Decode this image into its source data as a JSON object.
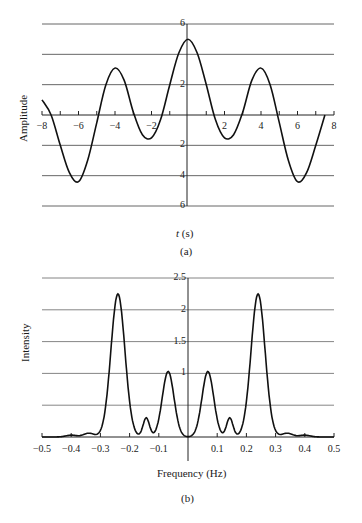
{
  "chart_data": [
    {
      "panel": "(a)",
      "type": "line",
      "title": "",
      "xlabel": "t (s)",
      "ylabel": "Amplitude",
      "xlim": [
        -8,
        8
      ],
      "ylim": [
        -6,
        6
      ],
      "x_ticks": [
        "-8",
        "-6",
        "-4",
        "-2",
        "2",
        "4",
        "6",
        "8"
      ],
      "y_ticks": [
        "6",
        "2",
        "2",
        "4",
        "6"
      ],
      "grid": "horizontal at -6,-4,-2,0,2,4,6",
      "series": [
        {
          "name": "signal",
          "x": [
            -8,
            -7.5,
            -7,
            -6.5,
            -6,
            -5.5,
            -5,
            -4.5,
            -4,
            -3.5,
            -3,
            -2.5,
            -2,
            -1.5,
            -1,
            -0.5,
            0,
            0.5,
            1,
            1.5,
            2,
            2.5,
            3,
            3.5,
            4,
            4.5,
            5,
            5.5,
            6,
            6.5,
            7,
            7.5
          ],
          "values": [
            1.0,
            0.0,
            -2.0,
            -3.8,
            -4.4,
            -3.0,
            -0.5,
            2.0,
            3.1,
            2.3,
            0.2,
            -1.3,
            -1.5,
            -0.3,
            2.0,
            4.1,
            5.0,
            4.1,
            2.0,
            -0.3,
            -1.5,
            -1.3,
            0.2,
            2.3,
            3.1,
            2.0,
            -0.5,
            -3.0,
            -4.4,
            -3.8,
            -2.0,
            0.0
          ]
        }
      ]
    },
    {
      "panel": "(b)",
      "type": "line",
      "title": "",
      "xlabel": "Frequency (Hz)",
      "ylabel": "Intensity",
      "xlim": [
        -0.5,
        0.5
      ],
      "ylim": [
        0,
        2.5
      ],
      "x_ticks": [
        "-0.5",
        "-0.4",
        "-0.3",
        "-0.2",
        "-0.1",
        "0.1",
        "0.2",
        "0.3",
        "0.4",
        "0.5"
      ],
      "y_ticks": [
        "2.5",
        "2",
        "1.5",
        "1"
      ],
      "grid": "horizontal at 0.5,1,1.5,2,2.5",
      "series": [
        {
          "name": "spectrum",
          "peaks": [
            {
              "x": -0.4,
              "y": 0.03
            },
            {
              "x": -0.34,
              "y": 0.06
            },
            {
              "x": -0.24,
              "y": 2.25
            },
            {
              "x": -0.145,
              "y": 0.3
            },
            {
              "x": -0.07,
              "y": 1.03
            },
            {
              "x": 0.07,
              "y": 1.03
            },
            {
              "x": 0.145,
              "y": 0.3
            },
            {
              "x": 0.24,
              "y": 2.25
            },
            {
              "x": 0.34,
              "y": 0.06
            },
            {
              "x": 0.4,
              "y": 0.03
            }
          ],
          "zeros": [
            -0.3,
            -0.175,
            -0.11,
            0.0,
            0.11,
            0.175,
            0.3
          ]
        }
      ]
    }
  ],
  "figure": {
    "panel_a": {
      "caption": "(a)",
      "ylabel": "Amplitude",
      "xlabel_var": "t",
      "xlabel_unit": " (s)",
      "x_ticks": [
        {
          "label": "−8",
          "v": -8
        },
        {
          "label": "−6",
          "v": -6
        },
        {
          "label": "−4",
          "v": -4
        },
        {
          "label": "−2",
          "v": -2
        },
        {
          "label": "2",
          "v": 2
        },
        {
          "label": "4",
          "v": 4
        },
        {
          "label": "6",
          "v": 6
        },
        {
          "label": "8",
          "v": 8
        }
      ],
      "y_ticks": [
        {
          "label": "6",
          "v": 6
        },
        {
          "label": "2",
          "v": 2
        },
        {
          "label": "2",
          "v": -2
        },
        {
          "label": "4",
          "v": -4
        },
        {
          "label": "6",
          "v": -6
        }
      ]
    },
    "panel_b": {
      "caption": "(b)",
      "ylabel": "Intensity",
      "xlabel": "Frequency (Hz)",
      "x_ticks": [
        {
          "label": "−0.5",
          "v": -0.5
        },
        {
          "label": "−0.4",
          "v": -0.4
        },
        {
          "label": "−0.3",
          "v": -0.3
        },
        {
          "label": "−0.2",
          "v": -0.2
        },
        {
          "label": "−0.1",
          "v": -0.1
        },
        {
          "label": "0.1",
          "v": 0.1
        },
        {
          "label": "0.2",
          "v": 0.2
        },
        {
          "label": "0.3",
          "v": 0.3
        },
        {
          "label": "0.4",
          "v": 0.4
        },
        {
          "label": "0.5",
          "v": 0.5
        }
      ],
      "y_ticks": [
        {
          "label": "2.5",
          "v": 2.5
        },
        {
          "label": "2",
          "v": 2
        },
        {
          "label": "1.5",
          "v": 1.5
        },
        {
          "label": "1",
          "v": 1
        }
      ]
    }
  }
}
